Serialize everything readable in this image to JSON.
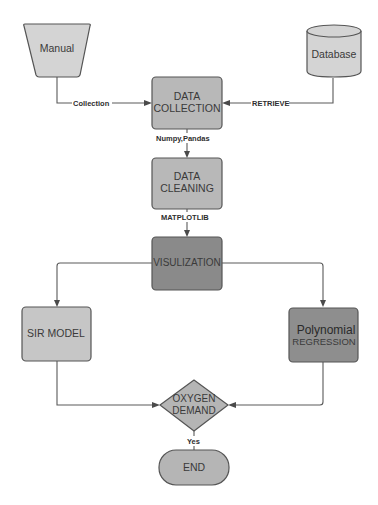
{
  "diagram": {
    "type": "flowchart",
    "nodes": {
      "manual": {
        "label": "Manual",
        "shape": "trapezoid",
        "fill": "#d4d4d4"
      },
      "database": {
        "label": "Database",
        "shape": "cylinder",
        "fill": "#d4d4d4"
      },
      "data_collection": {
        "line1": "DATA",
        "line2": "COLLECTION",
        "shape": "rounded-rect",
        "fill": "#b8b8b8"
      },
      "data_cleaning": {
        "line1": "DATA",
        "line2": "CLEANING",
        "shape": "rounded-rect",
        "fill": "#b8b8b8"
      },
      "visualization": {
        "label": "VISULIZATION",
        "shape": "rounded-rect",
        "fill": "#8a8a8a"
      },
      "sir_model": {
        "label": "SIR MODEL",
        "shape": "rounded-rect",
        "fill": "#c6c6c6"
      },
      "polynomial_regression": {
        "line1": "Polynomial",
        "line2": "REGRESSION",
        "shape": "rounded-rect",
        "fill": "#8e8e8e"
      },
      "oxygen_demand": {
        "line1": "OXYGEN",
        "line2": "DEMAND",
        "shape": "diamond",
        "fill": "#b5b5b5"
      },
      "end": {
        "label": "END",
        "shape": "terminator",
        "fill": "#b5b5b5"
      }
    },
    "edges": {
      "manual_to_collection": {
        "label": "Collection"
      },
      "database_to_collection": {
        "label": "RETRIEVE"
      },
      "collection_to_cleaning": {
        "label": "Numpy,Pandas"
      },
      "cleaning_to_visualization": {
        "label": "MATPLOTLIB"
      },
      "visualization_to_sir": {
        "label": ""
      },
      "visualization_to_polynomial": {
        "label": ""
      },
      "sir_to_oxygen": {
        "label": ""
      },
      "polynomial_to_oxygen": {
        "label": ""
      },
      "oxygen_to_end": {
        "label": "Yes"
      }
    }
  }
}
